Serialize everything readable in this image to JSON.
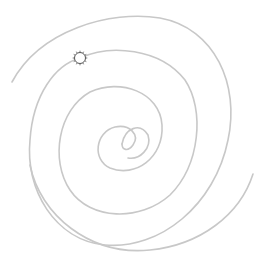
{
  "diagram": {
    "type": "double-spiral",
    "background": "#ffffff",
    "line_color": "#c8c8c8",
    "marker_color": "#555555",
    "center": [
      130,
      138
    ],
    "arms": [
      {
        "name": "arm-a",
        "path": "M 12 82 C 40 30, 110 10, 160 18 C 215 28, 240 85, 228 140 C 215 205, 160 250, 105 245 C 55 240, 25 190, 30 140 C 33 95, 55 65, 80 58"
      },
      {
        "name": "arm-b",
        "path": "M 80 58 C 110 44, 160 48, 185 80 C 205 110, 200 165, 170 195 C 140 222, 90 220, 70 190 C 50 160, 58 110, 90 92 C 120 78, 160 92, 162 125 C 164 158, 135 178, 110 168 C 92 160, 95 132, 115 127 C 130 124, 140 135, 133 145 C 128 152, 122 150, 122 144"
      },
      {
        "name": "arm-c",
        "path": "M 253 174 C 240 215, 200 245, 150 250 C 90 256, 40 215, 30 165"
      },
      {
        "name": "arm-d",
        "path": "M 122 144 C 125 128, 140 122, 148 135 C 152 148, 140 160, 128 158"
      }
    ],
    "marker": {
      "name": "sun-marker",
      "cx": 80,
      "cy": 58,
      "r": 5.5,
      "rays": 12
    }
  }
}
